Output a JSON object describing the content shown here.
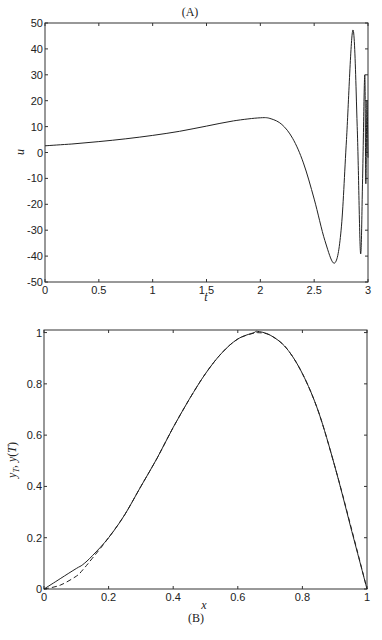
{
  "chart_data": [
    {
      "panel": "(A)",
      "type": "line",
      "title": "(A)",
      "xlabel": "t",
      "ylabel": "u",
      "xlim": [
        0,
        3
      ],
      "ylim": [
        -50,
        50
      ],
      "xticks": [
        "0",
        "0.5",
        "1",
        "1.5",
        "2",
        "2.5",
        "3"
      ],
      "yticks": [
        "50",
        "40",
        "30",
        "20",
        "10",
        "0",
        "-10",
        "-20",
        "-30",
        "-40",
        "-50"
      ],
      "grid": false,
      "series": [
        {
          "name": "u(t)",
          "style": "solid",
          "x": [
            0,
            0.25,
            0.5,
            0.75,
            1.0,
            1.25,
            1.5,
            1.75,
            2.0,
            2.1,
            2.2,
            2.3,
            2.4,
            2.5,
            2.6,
            2.69,
            2.75,
            2.8,
            2.86,
            2.9,
            2.93,
            2.95,
            2.97,
            2.98,
            2.99,
            3.0
          ],
          "y": [
            2.6,
            3.3,
            4.2,
            5.3,
            6.6,
            8.2,
            10.2,
            12.2,
            13.4,
            13.0,
            10.8,
            5.5,
            -4.0,
            -18.0,
            -34.0,
            -42.7,
            -30.0,
            5.0,
            47.3,
            10.0,
            -38.8,
            -10.0,
            30.0,
            -12.0,
            20.0,
            -2.0
          ]
        }
      ]
    },
    {
      "panel": "(B)",
      "type": "line",
      "title": "(B)",
      "xlabel": "x",
      "ylabel": "y_T, y(T)",
      "xlim": [
        0,
        1
      ],
      "ylim": [
        0,
        1.01
      ],
      "xticks": [
        "0",
        "0.2",
        "0.4",
        "0.6",
        "0.8",
        "1"
      ],
      "yticks": [
        "0",
        "0.2",
        "0.4",
        "0.6",
        "0.8",
        "1"
      ],
      "grid": false,
      "series": [
        {
          "name": "y(T)",
          "style": "solid",
          "x": [
            0,
            0.05,
            0.1,
            0.12,
            0.15,
            0.2,
            0.25,
            0.3,
            0.35,
            0.4,
            0.45,
            0.5,
            0.55,
            0.6,
            0.65,
            0.66,
            0.7,
            0.75,
            0.8,
            0.85,
            0.9,
            0.95,
            1.0
          ],
          "y": [
            0,
            0.04,
            0.08,
            0.095,
            0.13,
            0.2,
            0.29,
            0.4,
            0.51,
            0.63,
            0.74,
            0.84,
            0.92,
            0.975,
            1.0,
            1.005,
            0.99,
            0.94,
            0.84,
            0.69,
            0.48,
            0.24,
            0
          ]
        },
        {
          "name": "y_T",
          "style": "dashed",
          "x": [
            0,
            0.05,
            0.1,
            0.12,
            0.15,
            0.2,
            0.25,
            0.3,
            0.35,
            0.4,
            0.45,
            0.5,
            0.55,
            0.6,
            0.65,
            0.66,
            0.7,
            0.75,
            0.8,
            0.85,
            0.9,
            0.95,
            1.0
          ],
          "y": [
            0,
            0.015,
            0.05,
            0.075,
            0.12,
            0.2,
            0.29,
            0.4,
            0.51,
            0.63,
            0.74,
            0.84,
            0.92,
            0.975,
            0.998,
            1.0,
            0.99,
            0.94,
            0.84,
            0.69,
            0.48,
            0.245,
            0
          ]
        }
      ]
    }
  ],
  "labels": {
    "panelA": "(A)",
    "panelB": "(B)",
    "A_xlabel": "t",
    "A_ylabel": "u",
    "B_xlabel": "x"
  }
}
